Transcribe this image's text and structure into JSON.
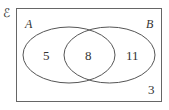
{
  "diagram": {
    "type": "venn",
    "universal_label": "ℰ",
    "sets": [
      {
        "label": "A",
        "only_count": "5"
      },
      {
        "label": "B",
        "only_count": "11"
      }
    ],
    "intersection_count": "8",
    "outside_count": "3",
    "colors": {
      "stroke": "#555555",
      "text": "#333333",
      "background": "#ffffff"
    }
  }
}
